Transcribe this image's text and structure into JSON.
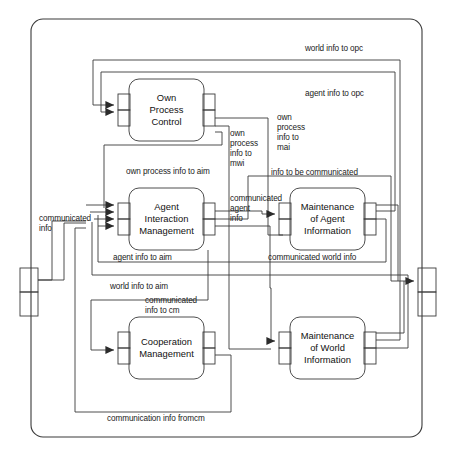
{
  "diagram": {
    "outer_container": {
      "name": "agent-boundary"
    },
    "processes": [
      {
        "id": "opc",
        "label": "Own\nProcess\nControl"
      },
      {
        "id": "aim",
        "label": "Agent\nInteraction\nManagement"
      },
      {
        "id": "mai",
        "label": "Maintenance\nof Agent\nInformation"
      },
      {
        "id": "cm",
        "label": "Cooperation\nManagement"
      },
      {
        "id": "mwi",
        "label": "Maintenance\nof World\nInformation"
      }
    ],
    "flow_labels": [
      {
        "id": "world-info-to-opc",
        "text": "world info to opc"
      },
      {
        "id": "agent-info-to-opc",
        "text": "agent info to opc"
      },
      {
        "id": "own-process-info-to-mwi",
        "text": "own\nprocess\ninfo to\nmwi"
      },
      {
        "id": "own-process-info-to-mai",
        "text": "own\nprocess\ninfo to\nmai"
      },
      {
        "id": "own-process-info-to-aim",
        "text": "own process info to aim"
      },
      {
        "id": "info-to-be-communicated",
        "text": "info to be communicated"
      },
      {
        "id": "communicated-agent-info",
        "text": "communicated\nagent\ninfo"
      },
      {
        "id": "communicated-info",
        "text": "communicated\ninfo"
      },
      {
        "id": "agent-info-to-aim",
        "text": "agent info to aim"
      },
      {
        "id": "communicated-world-info",
        "text": "communicated world info"
      },
      {
        "id": "world-info-to-aim",
        "text": "world info to aim"
      },
      {
        "id": "communicated-info-to-cm",
        "text": "communicated\ninfo to cm"
      },
      {
        "id": "communication-info-fromcm",
        "text": "communication info fromcm"
      }
    ],
    "ports": {
      "external_input": "external-input-port",
      "external_output": "external-output-port"
    },
    "colors": {
      "line": "#3a3a3a",
      "text": "#1a1a1a",
      "background": "#ffffff"
    }
  }
}
